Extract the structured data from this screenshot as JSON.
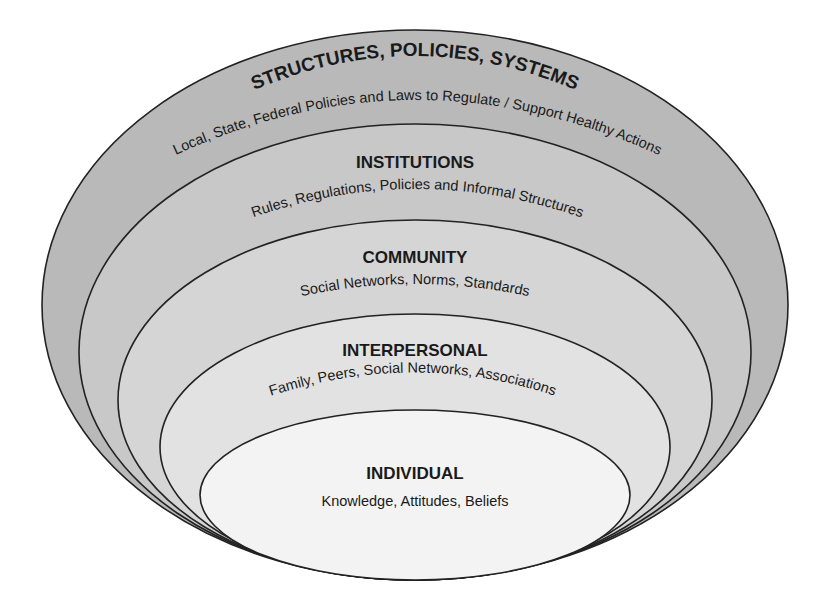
{
  "diagram": {
    "type": "nested-ellipses",
    "layers": [
      {
        "id": "structures",
        "title": "STRUCTURES, POLICIES, SYSTEMS",
        "subtitle": "Local, State, Federal Policies and Laws to Regulate / Support Healthy Actions",
        "fill": "#b9b9b9"
      },
      {
        "id": "institutions",
        "title": "INSTITUTIONS",
        "subtitle": "Rules, Regulations, Policies and Informal Structures",
        "fill": "#c8c8c8"
      },
      {
        "id": "community",
        "title": "COMMUNITY",
        "subtitle": "Social Networks, Norms, Standards",
        "fill": "#d5d5d5"
      },
      {
        "id": "interpersonal",
        "title": "INTERPERSONAL",
        "subtitle": "Family, Peers, Social Networks, Associations",
        "fill": "#e2e2e2"
      },
      {
        "id": "individual",
        "title": "INDIVIDUAL",
        "subtitle": "Knowledge, Attitudes, Beliefs",
        "fill": "#f3f3f3"
      }
    ],
    "stroke": "#222222"
  }
}
